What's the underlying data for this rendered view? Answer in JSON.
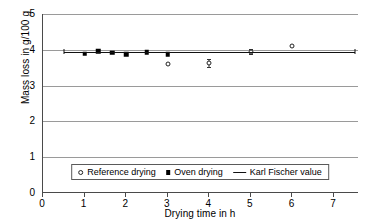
{
  "chart_data": {
    "type": "scatter",
    "title": "",
    "xlabel": "Drying time in h",
    "ylabel": "Mass loss in g/100 g",
    "xlim": [
      0,
      7.6
    ],
    "ylim": [
      0,
      5
    ],
    "xticks": [
      0,
      1,
      2,
      3,
      4,
      5,
      6,
      7
    ],
    "yticks": [
      0,
      1,
      2,
      3,
      4,
      5
    ],
    "grid": "horizontal",
    "legend_position": "bottom-center-inside",
    "series": [
      {
        "name": "Reference drying",
        "marker": "open-circle",
        "points": [
          {
            "x": 3.0,
            "y": 3.6
          },
          {
            "x": 4.0,
            "y": 3.63,
            "yerr": 0.11
          },
          {
            "x": 5.0,
            "y": 3.95,
            "yerr": 0.07
          },
          {
            "x": 6.0,
            "y": 4.12
          }
        ]
      },
      {
        "name": "Oven drying",
        "marker": "filled-square",
        "points": [
          {
            "x": 1.0,
            "y": 3.89
          },
          {
            "x": 1.33,
            "y": 3.96
          },
          {
            "x": 1.67,
            "y": 3.92
          },
          {
            "x": 2.0,
            "y": 3.88
          },
          {
            "x": 2.5,
            "y": 3.93
          },
          {
            "x": 3.0,
            "y": 3.87
          }
        ]
      },
      {
        "name": "Karl Fischer value",
        "marker": "line",
        "value": 3.95,
        "x_start": 0.5,
        "x_end": 7.5,
        "error_caps": 0.08
      }
    ]
  },
  "legend": {
    "items": [
      {
        "label": "Reference drying",
        "symbol": "open-circle-icon"
      },
      {
        "label": "Oven drying",
        "symbol": "filled-square-icon"
      },
      {
        "label": "Karl Fischer value",
        "symbol": "line-icon"
      }
    ]
  }
}
